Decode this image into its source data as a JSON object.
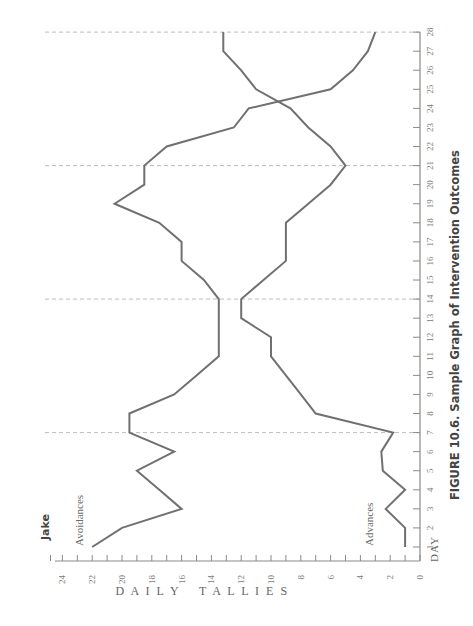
{
  "chart_data": {
    "type": "line",
    "orientation": "rotated-90-ccw",
    "title": "Jake",
    "caption": "FIGURE 10.6.  Sample Graph of Intervention Outcomes",
    "xlabel": "DAY",
    "ylabel": "DAILY TALLIES",
    "x": [
      1,
      2,
      3,
      4,
      5,
      6,
      7,
      8,
      9,
      10,
      11,
      12,
      13,
      14,
      15,
      16,
      17,
      18,
      19,
      20,
      21,
      22,
      23,
      24,
      25,
      26,
      27,
      28
    ],
    "x_ticks": [
      "1",
      "2",
      "3",
      "4",
      "5",
      "6",
      "7",
      "8",
      "9",
      "10",
      "11",
      "12",
      "13",
      "14",
      "15",
      "16",
      "17",
      "18",
      "19",
      "20",
      "21",
      "22",
      "23",
      "24",
      "25",
      "26",
      "27",
      "28"
    ],
    "y_ticks": [
      "0",
      "2",
      "4",
      "6",
      "8",
      "10",
      "12",
      "14",
      "16",
      "18",
      "20",
      "22",
      "24"
    ],
    "ylim": [
      0,
      24.5
    ],
    "xlim": [
      0.5,
      28
    ],
    "phase_lines_at_day": [
      7,
      14,
      21,
      28
    ],
    "grid": false,
    "legend": "inline labels",
    "series": [
      {
        "name": "Avoidances",
        "color": "#707070",
        "values": [
          22,
          20,
          16,
          17.5,
          19,
          16.5,
          19.5,
          19.5,
          16.5,
          15,
          13.5,
          13.5,
          13.5,
          13.5,
          14.5,
          16,
          16,
          17.5,
          20.5,
          18.5,
          18.5,
          17,
          12.5,
          11.5,
          6,
          4.5,
          3.5,
          3
        ]
      },
      {
        "name": "Advances",
        "color": "#707070",
        "values": [
          1,
          1,
          2.3,
          1,
          2.5,
          2.6,
          1.8,
          7,
          8,
          9,
          10,
          10,
          12,
          12,
          10.5,
          9,
          9,
          9,
          7.5,
          6,
          5,
          6,
          7.5,
          8.7,
          11,
          12,
          13.2,
          13.2
        ]
      }
    ]
  },
  "labels": {
    "subject": "Jake",
    "caption": "FIGURE 10.6.  Sample Graph of Intervention Outcomes",
    "x_axis_title": "DAY",
    "y_axis_title_1": "D A I L Y",
    "y_axis_title_2": "T A L L I E S",
    "series_1": "Avoidances",
    "series_2": "Advances"
  }
}
